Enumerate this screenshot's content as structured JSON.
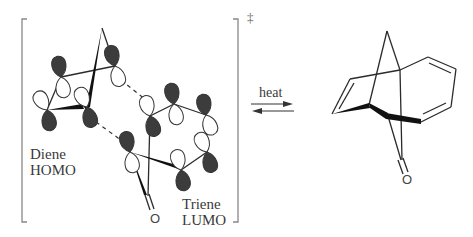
{
  "diagram": {
    "type": "reaction-scheme",
    "transition_state": {
      "marker": "‡",
      "labels": {
        "diene": [
          "Diene",
          "HOMO"
        ],
        "triene": [
          "Triene",
          "LUMO"
        ],
        "carbonyl_oxygen": "O"
      }
    },
    "arrow": {
      "label": "heat",
      "type": "equilibrium"
    },
    "product": {
      "carbonyl_oxygen": "O"
    },
    "colors": {
      "ink": "#2b2b2b",
      "lobe_dark": "#3c3c3c",
      "lobe_light": "#ffffff",
      "bracket": "#888888"
    }
  }
}
